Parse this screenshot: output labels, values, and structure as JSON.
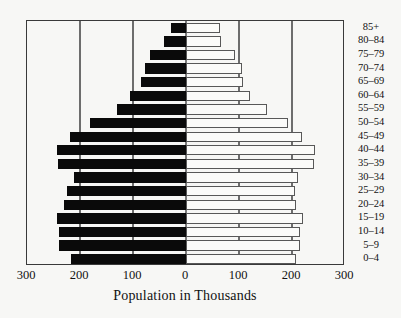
{
  "chart_data": {
    "type": "bar",
    "subtype": "population-pyramid",
    "title": "",
    "xlabel": "Population in Thousands",
    "ylabel": "",
    "orientation": "horizontal",
    "grid": true,
    "legend_position": "none",
    "xlim": [
      -300,
      300
    ],
    "xticks": [
      -300,
      -200,
      -100,
      0,
      100,
      200,
      300
    ],
    "xtick_labels": [
      "300",
      "200",
      "100",
      "0",
      "100",
      "200",
      "300"
    ],
    "categories": [
      "85+",
      "80–84",
      "75–79",
      "70–74",
      "65–69",
      "60–64",
      "55–59",
      "50–54",
      "45–49",
      "40–44",
      "35–39",
      "30–34",
      "25–29",
      "20–24",
      "15–19",
      "10–14",
      "5–9",
      "0–4"
    ],
    "series": [
      {
        "name": "Male",
        "side": "left",
        "color": "#0a0a0a",
        "values": [
          28,
          42,
          68,
          78,
          85,
          106,
          131,
          182,
          218,
          243,
          241,
          211,
          224,
          230,
          243,
          239,
          239,
          217
        ]
      },
      {
        "name": "Female",
        "side": "right",
        "color": "#fbfbf9",
        "values": [
          64,
          66,
          93,
          106,
          108,
          120,
          152,
          192,
          218,
          243,
          241,
          211,
          205,
          207,
          220,
          216,
          216,
          207
        ]
      }
    ]
  },
  "axis": {
    "tick_labels": [
      "300",
      "200",
      "100",
      "0",
      "100",
      "200",
      "300"
    ],
    "title": "Population in Thousands"
  }
}
